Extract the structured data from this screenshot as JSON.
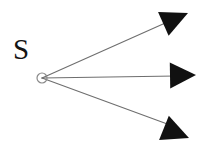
{
  "figure": {
    "name": "point-source-ray-diagram",
    "width": 207,
    "height": 145,
    "background_color": "#ffffff",
    "ray_color": "#6e6e6e",
    "arrowhead_color": "#111111",
    "label_color": "#141414",
    "source_marker_color": "#8a8a8a"
  },
  "label": {
    "source": "S",
    "x": 13,
    "y": 35,
    "font_size": 29
  },
  "source_point": {
    "name": "point-source",
    "cx": 42,
    "cy": 78,
    "r": 5,
    "fill": "none",
    "stroke": "#8a8a8a",
    "stroke_width": 1.2
  },
  "rays": [
    {
      "name": "ray-upper",
      "x1": 42,
      "y1": 78,
      "x2": 172,
      "y2": 20,
      "tip_x": 188,
      "tip_y": 13,
      "angle_deg": -24,
      "arrow_length": 27,
      "arrow_half_width": 13
    },
    {
      "name": "ray-middle",
      "x1": 42,
      "y1": 78,
      "x2": 176,
      "y2": 76,
      "tip_x": 196,
      "tip_y": 75,
      "angle_deg": -1,
      "arrow_length": 26,
      "arrow_half_width": 13
    },
    {
      "name": "ray-lower",
      "x1": 42,
      "y1": 78,
      "x2": 170,
      "y2": 125,
      "tip_x": 189,
      "tip_y": 138,
      "angle_deg": 22,
      "arrow_length": 27,
      "arrow_half_width": 13
    }
  ]
}
